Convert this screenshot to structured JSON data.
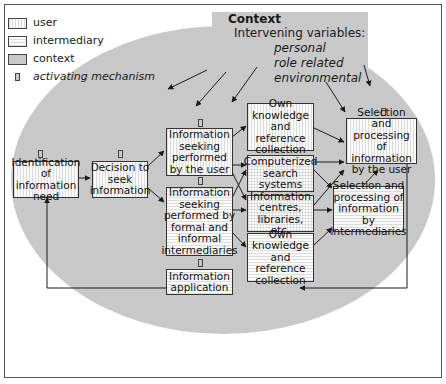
{
  "legend": {
    "items": [
      {
        "label": "user",
        "pattern": "vertical-hatch"
      },
      {
        "label": "intermediary",
        "pattern": "horizontal-hatch"
      },
      {
        "label": "context",
        "pattern": "grey-fill"
      },
      {
        "label": "activating mechanism",
        "pattern": "small-grey-rect-icon"
      }
    ]
  },
  "context": {
    "title": "Context",
    "subtitle": "Intervening variables:",
    "variables": [
      "personal",
      "role related",
      "environmental"
    ]
  },
  "colors": {
    "context_fill": "#c8c8c8",
    "box_border": "#333333",
    "frame_border": "#555555",
    "arrow": "#1a1a1a"
  },
  "nodes": {
    "identification": "Identification of information need",
    "decision": "Decision to seek information",
    "seeking_user": "Information seeking performed by the user",
    "seeking_intermediaries": "Information seeking performed by formal and informal intermediaries",
    "own_knowledge_user": "Own knowledge and reference collection",
    "computerized": "Computerized search systems",
    "info_centres": "Information centres, libraries, etc.",
    "own_knowledge_inter": "Own knowledge and reference collection",
    "selection_user": "Selection and processing of information by the user",
    "selection_inter": "Selection and processing of information by intermediaries",
    "application": "Information application"
  },
  "edges": [
    [
      "identification",
      "decision"
    ],
    [
      "decision",
      "seeking_user"
    ],
    [
      "decision",
      "seeking_intermediaries"
    ],
    [
      "seeking_user",
      "own_knowledge_user"
    ],
    [
      "seeking_user",
      "computerized"
    ],
    [
      "seeking_user",
      "info_centres"
    ],
    [
      "seeking_intermediaries",
      "computerized"
    ],
    [
      "seeking_intermediaries",
      "info_centres"
    ],
    [
      "seeking_intermediaries",
      "own_knowledge_inter"
    ],
    [
      "own_knowledge_user",
      "selection_user"
    ],
    [
      "computerized",
      "selection_user"
    ],
    [
      "computerized",
      "selection_inter"
    ],
    [
      "info_centres",
      "selection_user"
    ],
    [
      "info_centres",
      "selection_inter"
    ],
    [
      "own_knowledge_inter",
      "selection_inter"
    ],
    [
      "selection_inter",
      "selection_user"
    ],
    [
      "selection_user",
      "application"
    ],
    [
      "application",
      "identification"
    ]
  ]
}
